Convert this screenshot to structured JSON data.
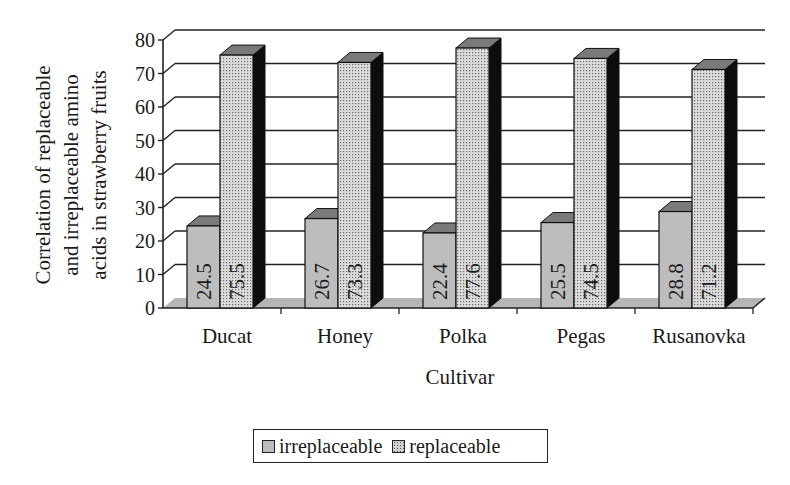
{
  "chart_data": {
    "type": "bar",
    "style": "3d-clustered-column",
    "title": "",
    "xlabel": "Cultivar",
    "ylabel": "Correlation of replaceable and irreplaceable amino acids in strawberry fruits",
    "ylabel_lines": [
      "Correlation of replaceable",
      "and irreplaceable amino",
      "acids in strawberry fruits"
    ],
    "categories": [
      "Ducat",
      "Honey",
      "Polka",
      "Pegas",
      "Rusanovka"
    ],
    "series": [
      {
        "name": "irreplaceable",
        "values": [
          24.5,
          26.7,
          22.4,
          25.5,
          28.8
        ],
        "color": "#bdbdbd",
        "pattern": "solid-gray"
      },
      {
        "name": "replaceable",
        "values": [
          75.5,
          73.3,
          77.6,
          74.5,
          71.2
        ],
        "color": "#d0d0d0",
        "pattern": "dotted-gray"
      }
    ],
    "ylim": [
      0,
      80
    ],
    "yticks": [
      0,
      10,
      20,
      30,
      40,
      50,
      60,
      70,
      80
    ],
    "grid": true,
    "data_labels": true,
    "data_label_orientation": "vertical",
    "legend_position": "bottom"
  },
  "legend": {
    "items": [
      {
        "label": "irreplaceable"
      },
      {
        "label": "replaceable"
      }
    ]
  }
}
